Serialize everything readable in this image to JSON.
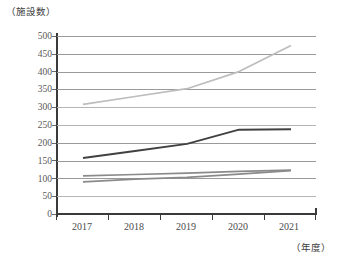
{
  "chart_data": {
    "type": "line",
    "title": "",
    "subtitle": "",
    "ylabel": "（施設数）",
    "xlabel": "（年度）",
    "categories": [
      "2017",
      "2018",
      "2019",
      "2020",
      "2021"
    ],
    "ylim": [
      0,
      500
    ],
    "ytick_step": 50,
    "yticks": [
      500,
      450,
      400,
      350,
      300,
      250,
      200,
      150,
      100,
      50,
      0
    ],
    "grid": true,
    "legend": "none",
    "series": [
      {
        "name": "series-1-light-gray",
        "color": "#bdbdbd",
        "values": [
          308,
          330,
          352,
          400,
          473
        ]
      },
      {
        "name": "series-2-dark-gray",
        "color": "#414141",
        "values": [
          157,
          177,
          197,
          237,
          238
        ]
      },
      {
        "name": "series-3-mid-gray",
        "color": "#8a8a8a",
        "values": [
          107,
          111,
          115,
          120,
          123
        ]
      },
      {
        "name": "series-4-mid-gray",
        "color": "#8a8a8a",
        "values": [
          90,
          98,
          103,
          112,
          122
        ]
      }
    ]
  }
}
